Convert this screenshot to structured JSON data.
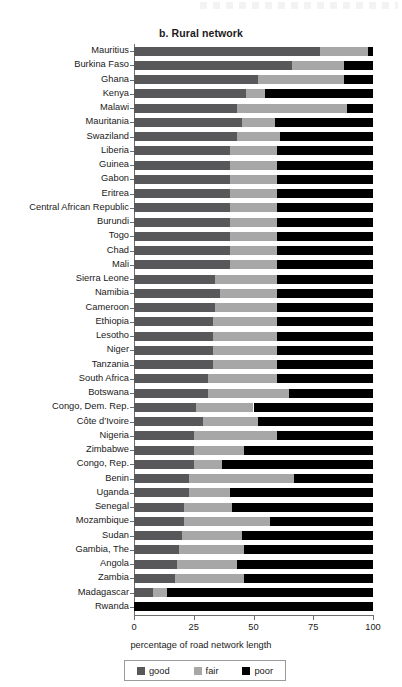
{
  "chart_data": {
    "type": "bar",
    "orientation": "horizontal",
    "stacked": true,
    "title": "b. Rural network",
    "xlabel": "percentage of road network length",
    "ylabel": "",
    "xlim": [
      0,
      100
    ],
    "xticks": [
      0,
      25,
      50,
      75,
      100
    ],
    "xtick_labels": [
      "0",
      "25",
      "50",
      "75",
      "100"
    ],
    "grid": false,
    "legend_position": "bottom",
    "legend": [
      {
        "name": "good",
        "color": "#58585a"
      },
      {
        "name": "fair",
        "color": "#a7a7a7"
      },
      {
        "name": "poor",
        "color": "#000000"
      }
    ],
    "categories": [
      "Mauritius",
      "Burkina Faso",
      "Ghana",
      "Kenya",
      "Malawi",
      "Mauritania",
      "Swaziland",
      "Liberia",
      "Guinea",
      "Gabon",
      "Eritrea",
      "Central African Republic",
      "Burundi",
      "Togo",
      "Chad",
      "Mali",
      "Sierra Leone",
      "Namibia",
      "Cameroon",
      "Ethiopia",
      "Lesotho",
      "Niger",
      "Tanzania",
      "South Africa",
      "Botswana",
      "Congo, Dem. Rep.",
      "Côte d’Ivoire",
      "Nigeria",
      "Zimbabwe",
      "Congo, Rep.",
      "Benin",
      "Uganda",
      "Senegal",
      "Mozambique",
      "Sudan",
      "Gambia, The",
      "Angola",
      "Zambia",
      "Madagascar",
      "Rwanda"
    ],
    "series": [
      {
        "name": "good",
        "color": "#58585a",
        "values": [
          78,
          66,
          52,
          47,
          43,
          45,
          43,
          40,
          40,
          40,
          40,
          40,
          40,
          40,
          40,
          40,
          34,
          36,
          34,
          33,
          33,
          33,
          33,
          31,
          31,
          26,
          29,
          25,
          25,
          25,
          23,
          23,
          21,
          21,
          20,
          19,
          18,
          17,
          8,
          0
        ]
      },
      {
        "name": "fair",
        "color": "#a7a7a7",
        "values": [
          20,
          22,
          36,
          8,
          46,
          14,
          18,
          20,
          20,
          20,
          20,
          20,
          20,
          20,
          20,
          20,
          26,
          24,
          26,
          27,
          27,
          27,
          27,
          29,
          34,
          24,
          23,
          35,
          21,
          12,
          44,
          17,
          20,
          36,
          25,
          27,
          25,
          29,
          6,
          0
        ]
      },
      {
        "name": "poor",
        "color": "#000000",
        "values": [
          2,
          12,
          12,
          45,
          11,
          41,
          39,
          40,
          40,
          40,
          40,
          40,
          40,
          40,
          40,
          40,
          40,
          40,
          40,
          40,
          40,
          40,
          40,
          40,
          35,
          50,
          48,
          40,
          54,
          63,
          33,
          60,
          59,
          43,
          55,
          54,
          57,
          54,
          86,
          100
        ]
      }
    ]
  }
}
